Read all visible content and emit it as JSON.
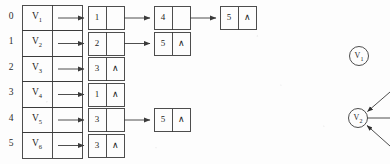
{
  "figure": {
    "type": "adjacency-list-diagram",
    "null_symbol": "∧",
    "ink_color": "#3a3a3a",
    "background_color": "#fdfdfd"
  },
  "array": {
    "indices": [
      "0",
      "1",
      "2",
      "3",
      "4",
      "5"
    ],
    "vertices": [
      {
        "label": "V",
        "sub": "1"
      },
      {
        "label": "V",
        "sub": "2"
      },
      {
        "label": "V",
        "sub": "3"
      },
      {
        "label": "V",
        "sub": "4"
      },
      {
        "label": "V",
        "sub": "5"
      },
      {
        "label": "V",
        "sub": "6"
      }
    ]
  },
  "adjacency_lists": [
    {
      "index": "0",
      "vertex": "V1",
      "nodes": [
        "1",
        "4",
        "5"
      ]
    },
    {
      "index": "1",
      "vertex": "V2",
      "nodes": [
        "2",
        "5"
      ]
    },
    {
      "index": "2",
      "vertex": "V3",
      "nodes": [
        "3"
      ]
    },
    {
      "index": "3",
      "vertex": "V4",
      "nodes": [
        "1"
      ]
    },
    {
      "index": "4",
      "vertex": "V5",
      "nodes": [
        "3",
        "5"
      ]
    },
    {
      "index": "5",
      "vertex": "V6",
      "nodes": [
        "3"
      ]
    }
  ],
  "graph": {
    "nodes": [
      {
        "label": "V",
        "sub": "1"
      },
      {
        "label": "V",
        "sub": "2"
      }
    ],
    "edge_count_at_v2": 3
  }
}
